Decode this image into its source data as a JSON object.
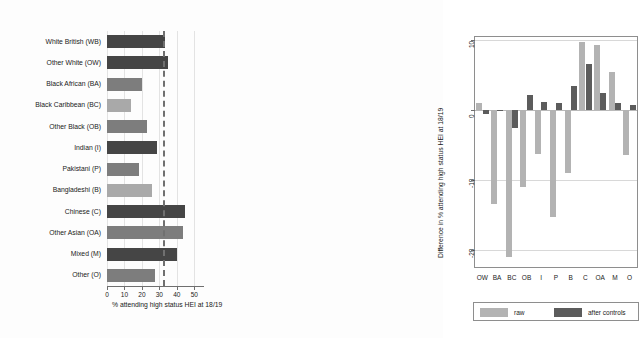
{
  "chart_data": [
    {
      "type": "bar",
      "orientation": "horizontal",
      "panel": "left",
      "title": "",
      "xlabel": "% attending high status HEI at 18/19",
      "ylabel": "",
      "xlim": [
        0,
        55
      ],
      "xticks": [
        0,
        10,
        20,
        30,
        40,
        50
      ],
      "grid": true,
      "reference_line": {
        "value": 32,
        "style": "dashed",
        "color": "#707070"
      },
      "categories": [
        "White British (WB)",
        "Other White (OW)",
        "Black African (BA)",
        "Black Caribbean (BC)",
        "Other Black (OB)",
        "Indian (I)",
        "Pakistani (P)",
        "Bangladeshi (B)",
        "Chinese (C)",
        "Other Asian (OA)",
        "Mixed (M)",
        "Other (O)"
      ],
      "values": [
        33,
        35,
        20,
        13.5,
        23,
        28.5,
        18.5,
        25.5,
        44.5,
        43.5,
        40,
        27.5
      ],
      "bar_shades": [
        "dark",
        "dark",
        "mid",
        "light",
        "mid",
        "dark",
        "mid",
        "light",
        "dark",
        "mid",
        "dark",
        "mid"
      ]
    },
    {
      "type": "bar",
      "orientation": "vertical",
      "panel": "right",
      "title": "",
      "xlabel": "",
      "ylabel": "Difference in % attending high status HEI at 18/19",
      "ylim": [
        -22.5,
        10.5
      ],
      "yticks": [
        10,
        0,
        -10,
        -20
      ],
      "grid": true,
      "categories": [
        "OW",
        "BA",
        "BC",
        "OB",
        "I",
        "P",
        "B",
        "C",
        "OA",
        "M",
        "O"
      ],
      "series": [
        {
          "name": "raw",
          "color": "#b3b3b3",
          "values": [
            1.0,
            -13.5,
            -21.0,
            -11.0,
            -6.3,
            -15.3,
            -9.0,
            9.8,
            9.3,
            5.5,
            -6.5
          ]
        },
        {
          "name": "after controls",
          "color": "#5c5c5c",
          "values": [
            -0.6,
            -0.1,
            -2.6,
            2.2,
            1.2,
            1.0,
            3.5,
            6.6,
            2.4,
            1.0,
            0.7
          ]
        }
      ],
      "legend": {
        "position": "bottom",
        "entries": [
          {
            "label": "raw",
            "color": "#b3b3b3"
          },
          {
            "label": "after controls",
            "color": "#5c5c5c"
          }
        ]
      }
    }
  ],
  "left": {
    "axis_title": "% attending high status HEI at 18/19",
    "xticks": [
      "0",
      "10",
      "20",
      "30",
      "40",
      "50"
    ],
    "categories": [
      "White British (WB)",
      "Other White (OW)",
      "Black African (BA)",
      "Black Caribbean (BC)",
      "Other Black (OB)",
      "Indian (I)",
      "Pakistani (P)",
      "Bangladeshi (B)",
      "Chinese (C)",
      "Other Asian (OA)",
      "Mixed (M)",
      "Other (O)"
    ]
  },
  "right": {
    "axis_title": "Difference in % attending high status HEI at 18/19",
    "yticks": [
      "10",
      "0",
      "-10",
      "-20"
    ],
    "categories": [
      "OW",
      "BA",
      "BC",
      "OB",
      "I",
      "P",
      "B",
      "C",
      "OA",
      "M",
      "O"
    ],
    "legend": {
      "raw_label": "raw",
      "controls_label": "after controls"
    }
  },
  "colors": {
    "bar_dark": "#454545",
    "bar_mid": "#7d7d7d",
    "bar_light": "#a9a9a9",
    "raw": "#b3b3b3",
    "controls": "#5c5c5c",
    "axis": "#6f6f6f",
    "grid": "#d8d8d8"
  }
}
